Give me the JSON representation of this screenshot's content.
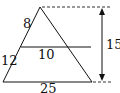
{
  "diagram": {
    "labels": {
      "upper_side": "8",
      "lower_side": "12",
      "mid_segment": "10",
      "base": "25",
      "height": "15"
    },
    "colors": {
      "stroke": "#111111",
      "dashed": "#333333"
    }
  }
}
